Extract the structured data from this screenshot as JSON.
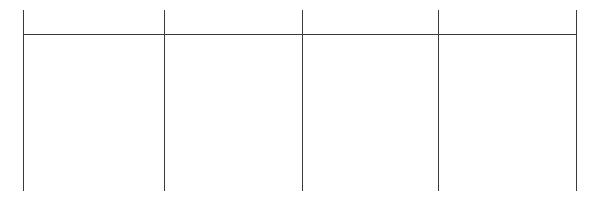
{
  "diagram": {
    "type": "table-grid-outline",
    "line_color": "#3a3a3a",
    "background": "#ffffff",
    "columns": 4,
    "vertical_lines_x": [
      23,
      164,
      302,
      438,
      576
    ],
    "vertical_top": 10,
    "vertical_bottom": 191,
    "header_line_y": 34,
    "cells": [
      {
        "header": "",
        "body": ""
      },
      {
        "header": "",
        "body": ""
      },
      {
        "header": "",
        "body": ""
      },
      {
        "header": "",
        "body": ""
      }
    ]
  }
}
